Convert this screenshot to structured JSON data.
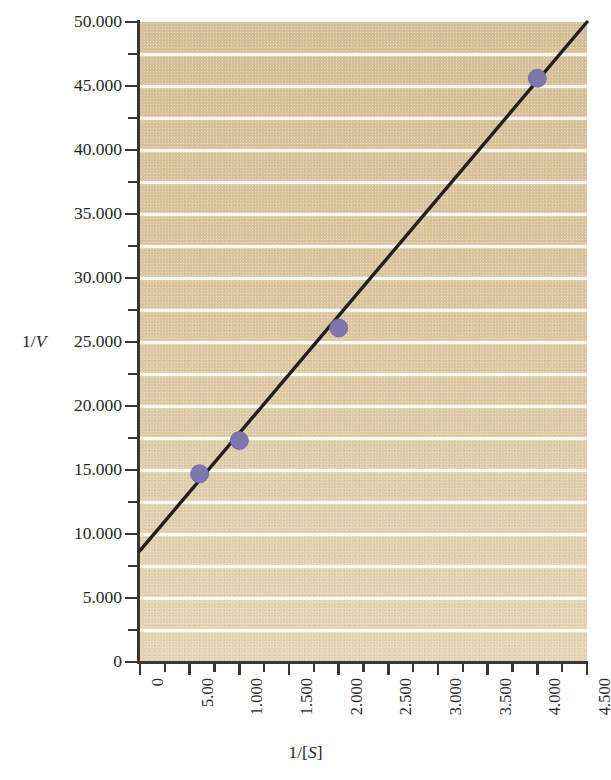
{
  "chart_data": {
    "type": "scatter",
    "title": "",
    "subtitle": "",
    "xlabel": "1/[S]",
    "ylabel": "1/V",
    "xlim": [
      0,
      4.5
    ],
    "ylim": [
      0,
      50
    ],
    "grid": true,
    "legend": "none",
    "x_ticks": [
      "0",
      "5.00",
      "1.000",
      "1.500",
      "2.000",
      "2.500",
      "3.000",
      "3.500",
      "4.000",
      "4.500"
    ],
    "x_tick_values": [
      0,
      0.5,
      1.0,
      1.5,
      2.0,
      2.5,
      3.0,
      3.5,
      4.0,
      4.5
    ],
    "y_ticks": [
      "0",
      "5.000",
      "10.000",
      "15.000",
      "20.000",
      "25.000",
      "30.000",
      "35.000",
      "40.000",
      "45.000",
      "50.000"
    ],
    "y_tick_values": [
      0,
      5,
      10,
      15,
      20,
      25,
      30,
      35,
      40,
      45,
      50
    ],
    "y_minor_step": 2.5,
    "series": [
      {
        "name": "data",
        "marker": "circle",
        "color": "#7d77ad",
        "x": [
          0.6,
          1.0,
          2.0,
          4.0
        ],
        "y": [
          14.7,
          17.3,
          26.1,
          45.6
        ]
      }
    ],
    "fit_line": {
      "name": "linear fit",
      "color": "#241f1c",
      "intercept": 8.7,
      "slope": 9.2,
      "x_start": 0.0,
      "y_start": 8.7,
      "x_end": 4.5,
      "y_end": 50.0
    },
    "colors": {
      "plot_background": "#dec9a3",
      "gridline": "#fffdf5",
      "axis": "#3a3733",
      "marker": "#7d77ad",
      "line": "#241f1c",
      "text": "#262626",
      "page_background": "#ffffff"
    }
  },
  "axis_titles": {
    "y_prefix": "1/",
    "y_italic": "V",
    "x_prefix": "1/[",
    "x_italic": "S",
    "x_suffix": "]"
  }
}
